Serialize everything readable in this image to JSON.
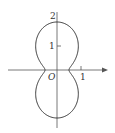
{
  "diagram": {
    "type": "polar-curve",
    "curve": {
      "formula": "r = 0.5 + 1.5 sin^2(theta)",
      "color": "#333333"
    },
    "axes": {
      "color": "#555555",
      "origin_label": "O"
    },
    "labels": {
      "y_tick_2": "2",
      "y_tick_1": "1",
      "x_tick_1": "1",
      "origin": "O"
    }
  }
}
